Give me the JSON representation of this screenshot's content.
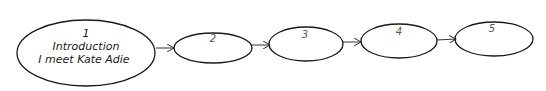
{
  "diagram": {
    "type": "flow-sequence",
    "nodes": [
      {
        "id": "1",
        "number": "1",
        "lines": [
          "Introduction",
          "I meet Kate Adie"
        ]
      },
      {
        "id": "2",
        "number": "2",
        "lines": []
      },
      {
        "id": "3",
        "number": "3",
        "lines": []
      },
      {
        "id": "4",
        "number": "4",
        "lines": []
      },
      {
        "id": "5",
        "number": "5",
        "lines": []
      }
    ],
    "edges": [
      {
        "from": "1",
        "to": "2"
      },
      {
        "from": "2",
        "to": "3"
      },
      {
        "from": "3",
        "to": "4"
      },
      {
        "from": "4",
        "to": "5"
      }
    ],
    "colors": {
      "stroke": "#1a1a1a",
      "background": "#ffffff"
    }
  }
}
